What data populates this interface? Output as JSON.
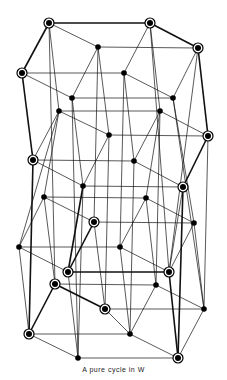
{
  "caption": "A pure cycle in W",
  "colors": {
    "edge": "#111111",
    "node_fill": "#000000",
    "ring_fill": "#ffffff"
  },
  "nodes": [
    {
      "id": "A",
      "x": 49,
      "y": 23,
      "circled": true
    },
    {
      "id": "B",
      "x": 150,
      "y": 23,
      "circled": true
    },
    {
      "id": "C",
      "x": 198,
      "y": 48,
      "circled": true
    },
    {
      "id": "D",
      "x": 98,
      "y": 47,
      "circled": false
    },
    {
      "id": "E",
      "x": 22,
      "y": 73,
      "circled": true
    },
    {
      "id": "F",
      "x": 124,
      "y": 73,
      "circled": false
    },
    {
      "id": "G",
      "x": 173,
      "y": 98,
      "circled": false
    },
    {
      "id": "H",
      "x": 72,
      "y": 98,
      "circled": false
    },
    {
      "id": "I",
      "x": 59,
      "y": 111,
      "circled": false
    },
    {
      "id": "J",
      "x": 160,
      "y": 111,
      "circled": false
    },
    {
      "id": "K",
      "x": 109,
      "y": 135,
      "circled": false
    },
    {
      "id": "L",
      "x": 208,
      "y": 136,
      "circled": true
    },
    {
      "id": "M",
      "x": 33,
      "y": 160,
      "circled": true
    },
    {
      "id": "N",
      "x": 134,
      "y": 161,
      "circled": false
    },
    {
      "id": "O",
      "x": 83,
      "y": 186,
      "circled": false
    },
    {
      "id": "P",
      "x": 183,
      "y": 187,
      "circled": true
    },
    {
      "id": "Q",
      "x": 44,
      "y": 197,
      "circled": false
    },
    {
      "id": "R",
      "x": 146,
      "y": 198,
      "circled": false
    },
    {
      "id": "S",
      "x": 94,
      "y": 222,
      "circled": true
    },
    {
      "id": "T",
      "x": 194,
      "y": 223,
      "circled": false
    },
    {
      "id": "U",
      "x": 19,
      "y": 247,
      "circled": false
    },
    {
      "id": "V",
      "x": 120,
      "y": 247,
      "circled": false
    },
    {
      "id": "W",
      "x": 68,
      "y": 272,
      "circled": true
    },
    {
      "id": "X",
      "x": 169,
      "y": 272,
      "circled": true
    },
    {
      "id": "Y",
      "x": 55,
      "y": 284,
      "circled": true
    },
    {
      "id": "Z",
      "x": 156,
      "y": 285,
      "circled": false
    },
    {
      "id": "a",
      "x": 105,
      "y": 309,
      "circled": true
    },
    {
      "id": "b",
      "x": 204,
      "y": 309,
      "circled": false
    },
    {
      "id": "c",
      "x": 29,
      "y": 334,
      "circled": true
    },
    {
      "id": "d",
      "x": 130,
      "y": 334,
      "circled": false
    },
    {
      "id": "e",
      "x": 78,
      "y": 358,
      "circled": false
    },
    {
      "id": "f",
      "x": 178,
      "y": 358,
      "circled": true
    }
  ],
  "edges": [
    {
      "a": "A",
      "b": "B",
      "bold": true
    },
    {
      "a": "B",
      "b": "C",
      "bold": true
    },
    {
      "a": "A",
      "b": "E",
      "bold": true
    },
    {
      "a": "A",
      "b": "D",
      "bold": false
    },
    {
      "a": "D",
      "b": "C",
      "bold": false
    },
    {
      "a": "D",
      "b": "H",
      "bold": false
    },
    {
      "a": "E",
      "b": "F",
      "bold": false
    },
    {
      "a": "B",
      "b": "F",
      "bold": false
    },
    {
      "a": "C",
      "b": "G",
      "bold": false
    },
    {
      "a": "E",
      "b": "H",
      "bold": false
    },
    {
      "a": "F",
      "b": "G",
      "bold": false
    },
    {
      "a": "H",
      "b": "G",
      "bold": false
    },
    {
      "a": "I",
      "b": "J",
      "bold": false
    },
    {
      "a": "I",
      "b": "K",
      "bold": false
    },
    {
      "a": "J",
      "b": "L",
      "bold": false
    },
    {
      "a": "I",
      "b": "M",
      "bold": false
    },
    {
      "a": "K",
      "b": "L",
      "bold": false
    },
    {
      "a": "M",
      "b": "N",
      "bold": false
    },
    {
      "a": "K",
      "b": "O",
      "bold": false
    },
    {
      "a": "M",
      "b": "O",
      "bold": false
    },
    {
      "a": "N",
      "b": "P",
      "bold": false
    },
    {
      "a": "L",
      "b": "P",
      "bold": true
    },
    {
      "a": "J",
      "b": "N",
      "bold": false
    },
    {
      "a": "O",
      "b": "P",
      "bold": false
    },
    {
      "a": "Q",
      "b": "R",
      "bold": false
    },
    {
      "a": "Q",
      "b": "S",
      "bold": false
    },
    {
      "a": "R",
      "b": "T",
      "bold": false
    },
    {
      "a": "Q",
      "b": "U",
      "bold": false
    },
    {
      "a": "S",
      "b": "T",
      "bold": false
    },
    {
      "a": "U",
      "b": "V",
      "bold": false
    },
    {
      "a": "R",
      "b": "V",
      "bold": false
    },
    {
      "a": "S",
      "b": "W",
      "bold": true
    },
    {
      "a": "T",
      "b": "X",
      "bold": false
    },
    {
      "a": "U",
      "b": "W",
      "bold": false
    },
    {
      "a": "V",
      "b": "X",
      "bold": false
    },
    {
      "a": "W",
      "b": "X",
      "bold": true
    },
    {
      "a": "Y",
      "b": "Z",
      "bold": false
    },
    {
      "a": "Y",
      "b": "a",
      "bold": true
    },
    {
      "a": "Z",
      "b": "b",
      "bold": false
    },
    {
      "a": "Y",
      "b": "c",
      "bold": true
    },
    {
      "a": "a",
      "b": "b",
      "bold": false
    },
    {
      "a": "c",
      "b": "d",
      "bold": false
    },
    {
      "a": "a",
      "b": "d",
      "bold": false
    },
    {
      "a": "Z",
      "b": "d",
      "bold": false
    },
    {
      "a": "b",
      "b": "f",
      "bold": false
    },
    {
      "a": "c",
      "b": "e",
      "bold": false
    },
    {
      "a": "d",
      "b": "f",
      "bold": false
    },
    {
      "a": "e",
      "b": "f",
      "bold": false
    },
    {
      "a": "E",
      "b": "M",
      "bold": true
    },
    {
      "a": "M",
      "b": "c",
      "bold": true
    },
    {
      "a": "C",
      "b": "L",
      "bold": true
    },
    {
      "a": "L",
      "b": "P",
      "bold": true
    },
    {
      "a": "P",
      "b": "f",
      "bold": true
    },
    {
      "a": "A",
      "b": "Y",
      "bold": false
    },
    {
      "a": "A",
      "b": "I",
      "bold": false
    },
    {
      "a": "B",
      "b": "J",
      "bold": false
    },
    {
      "a": "B",
      "b": "X",
      "bold": false
    },
    {
      "a": "D",
      "b": "K",
      "bold": false
    },
    {
      "a": "D",
      "b": "S",
      "bold": false
    },
    {
      "a": "F",
      "b": "N",
      "bold": false
    },
    {
      "a": "F",
      "b": "V",
      "bold": false
    },
    {
      "a": "G",
      "b": "T",
      "bold": false
    },
    {
      "a": "G",
      "b": "b",
      "bold": false
    },
    {
      "a": "H",
      "b": "O",
      "bold": false
    },
    {
      "a": "H",
      "b": "e",
      "bold": false
    },
    {
      "a": "I",
      "b": "Q",
      "bold": false
    },
    {
      "a": "I",
      "b": "U",
      "bold": false
    },
    {
      "a": "J",
      "b": "R",
      "bold": false
    },
    {
      "a": "J",
      "b": "Z",
      "bold": false
    },
    {
      "a": "K",
      "b": "a",
      "bold": false
    },
    {
      "a": "N",
      "b": "d",
      "bold": false
    },
    {
      "a": "O",
      "b": "W",
      "bold": true
    },
    {
      "a": "O",
      "b": "e",
      "bold": false
    },
    {
      "a": "P",
      "b": "X",
      "bold": false
    },
    {
      "a": "Q",
      "b": "Y",
      "bold": false
    },
    {
      "a": "R",
      "b": "Z",
      "bold": false
    },
    {
      "a": "S",
      "b": "a",
      "bold": false
    },
    {
      "a": "T",
      "b": "b",
      "bold": false
    },
    {
      "a": "U",
      "b": "c",
      "bold": false
    },
    {
      "a": "V",
      "b": "d",
      "bold": false
    },
    {
      "a": "W",
      "b": "e",
      "bold": false
    },
    {
      "a": "X",
      "b": "f",
      "bold": true
    },
    {
      "a": "C",
      "b": "X",
      "bold": false
    },
    {
      "a": "L",
      "b": "b",
      "bold": false
    }
  ]
}
